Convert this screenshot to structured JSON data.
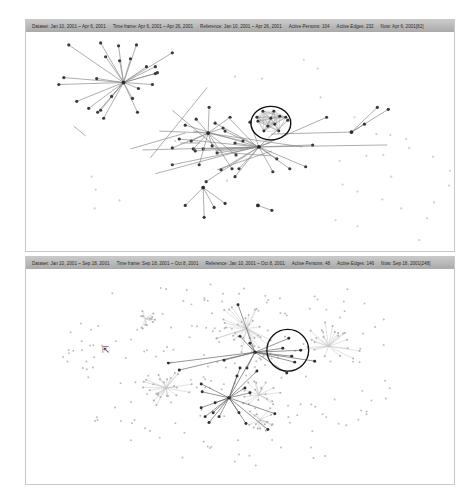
{
  "panels": [
    {
      "id": "top",
      "header": {
        "dataset": "Dataset: Jan 10, 2001 ~ Apr 6, 2001",
        "time_frame": "Time frame: Apr 6, 2001 ~ Apr 26, 2001",
        "reference": "Reference: Jan 10, 2001 ~ Apr 26, 2001",
        "active_persons": "Active Persons: 104",
        "active_edges": "Active Edges: 232",
        "now": "Now: Apr 6, 2001[82]"
      },
      "highlight_circle": {
        "cx": 246,
        "cy": 92,
        "r": 20
      },
      "hubs": [
        {
          "x": 98,
          "y": 51,
          "spokes": [
            [
              43,
              13
            ],
            [
              75,
              11
            ],
            [
              93,
              14
            ],
            [
              111,
              13
            ],
            [
              130,
              35
            ],
            [
              147,
              21
            ],
            [
              121,
              35
            ],
            [
              130,
              42
            ],
            [
              113,
              57
            ],
            [
              107,
              67
            ],
            [
              63,
              77
            ],
            [
              86,
              65
            ],
            [
              75,
              79
            ],
            [
              51,
              70
            ],
            [
              33,
              53
            ],
            [
              38,
              46
            ],
            [
              80,
              25
            ],
            [
              105,
              27
            ],
            [
              132,
              41
            ],
            [
              72,
              81
            ],
            [
              78,
              87
            ],
            [
              71,
              47
            ],
            [
              94,
              29
            ],
            [
              112,
              81
            ],
            [
              127,
              53
            ]
          ]
        },
        {
          "x": 234,
          "y": 116,
          "spokes": [
            [
              190,
              92
            ],
            [
              160,
              94
            ],
            [
              154,
              108
            ],
            [
              192,
              122
            ],
            [
              210,
              146
            ],
            [
              147,
              134
            ],
            [
              181,
              151
            ],
            [
              210,
              112
            ],
            [
              196,
              139
            ],
            [
              288,
              114
            ],
            [
              263,
              89
            ],
            [
              225,
              91
            ],
            [
              252,
              128
            ],
            [
              265,
              138
            ],
            [
              281,
              136
            ],
            [
              178,
              118
            ],
            [
              200,
              100
            ],
            [
              170,
              120
            ],
            [
              248,
              141
            ],
            [
              214,
              138
            ],
            [
              302,
              86
            ]
          ]
        },
        {
          "x": 183,
          "y": 102,
          "spokes": [
            [
              184,
              76
            ],
            [
              205,
              86
            ],
            [
              171,
              88
            ],
            [
              198,
              97
            ],
            [
              187,
              115
            ],
            [
              168,
              118
            ],
            [
              174,
              134
            ],
            [
              218,
              110
            ],
            [
              211,
              124
            ],
            [
              207,
              138
            ],
            [
              166,
              110
            ],
            [
              147,
              117
            ]
          ]
        },
        {
          "x": 178,
          "y": 157,
          "spokes": [
            [
              160,
              175
            ],
            [
              189,
              177
            ],
            [
              200,
              173
            ],
            [
              179,
              187
            ]
          ]
        },
        {
          "x": 327,
          "y": 101,
          "spokes": [
            [
              340,
              93
            ],
            [
              353,
              76
            ],
            [
              364,
              78
            ]
          ]
        },
        {
          "x": 233,
          "y": 175,
          "spokes": [
            [
              247,
              180
            ]
          ]
        }
      ],
      "edges": [
        [
          182,
          56,
          125,
          127
        ],
        [
          155,
          112,
          175,
          112
        ],
        [
          134,
          100,
          184,
          102
        ],
        [
          168,
          100,
          278,
          116
        ],
        [
          190,
          120,
          234,
          116
        ],
        [
          130,
          143,
          245,
          112
        ],
        [
          192,
          139,
          247,
          120
        ],
        [
          206,
          122,
          246,
          125
        ],
        [
          117,
          119,
          234,
          116
        ],
        [
          327,
          101,
          246,
          103
        ],
        [
          234,
          116,
          363,
          114
        ],
        [
          48,
          95,
          60,
          105
        ],
        [
          105,
          118,
          160,
          102
        ],
        [
          147,
          79,
          198,
          122
        ],
        [
          205,
          88,
          232,
          116
        ]
      ],
      "faint_nodes": [
        [
          210,
          45
        ],
        [
          279,
          28
        ],
        [
          293,
          37
        ],
        [
          237,
          47
        ],
        [
          296,
          66
        ],
        [
          330,
          86
        ],
        [
          352,
          103
        ],
        [
          382,
          108
        ],
        [
          385,
          117
        ],
        [
          342,
          125
        ],
        [
          359,
          124
        ],
        [
          366,
          104
        ],
        [
          315,
          130
        ],
        [
          367,
          146
        ],
        [
          318,
          154
        ],
        [
          333,
          161
        ],
        [
          358,
          169
        ],
        [
          311,
          190
        ],
        [
          333,
          196
        ],
        [
          377,
          178
        ],
        [
          395,
          210
        ],
        [
          403,
          188
        ],
        [
          410,
          172
        ],
        [
          425,
          155
        ],
        [
          426,
          140
        ],
        [
          409,
          126
        ],
        [
          66,
          146
        ],
        [
          70,
          159
        ],
        [
          69,
          178
        ],
        [
          94,
          170
        ],
        [
          150,
          110
        ],
        [
          202,
          150
        ]
      ],
      "cluster_nodes": [
        [
          238,
          80
        ],
        [
          249,
          80
        ],
        [
          261,
          86
        ],
        [
          254,
          100
        ],
        [
          239,
          100
        ],
        [
          233,
          90
        ],
        [
          246,
          87
        ],
        [
          250,
          93
        ],
        [
          243,
          95
        ],
        [
          232,
          86
        ],
        [
          255,
          85
        ]
      ]
    },
    {
      "id": "bottom",
      "header": {
        "dataset": "Dataset: Jan 10, 2001 ~ Sep 18, 2001",
        "time_frame": "Time frame: Sep 18, 2001 ~ Oct 8, 2001",
        "reference": "Reference: Jan 10, 2001 ~ Oct 8, 2001",
        "active_persons": "Active Persons: 48",
        "active_edges": "Active Edges: 146",
        "now": "Now: Sep 18, 2001[248]"
      },
      "highlight_circle": {
        "cx": 263,
        "cy": 82,
        "r": 21
      },
      "dark_hubs": [
        {
          "x": 230,
          "y": 84,
          "spokes": [
            [
              213,
              36
            ],
            [
              143,
              95
            ],
            [
              154,
              102
            ],
            [
              199,
              92
            ],
            [
              215,
              68
            ],
            [
              264,
              70
            ],
            [
              270,
              94
            ],
            [
              290,
              93
            ],
            [
              262,
              105
            ],
            [
              222,
              100
            ],
            [
              225,
              75
            ],
            [
              258,
              80
            ],
            [
              276,
              82
            ],
            [
              267,
              88
            ]
          ]
        },
        {
          "x": 204,
          "y": 130,
          "spokes": [
            [
              176,
              116
            ],
            [
              177,
              124
            ],
            [
              176,
              140
            ],
            [
              180,
              149
            ],
            [
              184,
              155
            ],
            [
              194,
              149
            ],
            [
              188,
              145
            ],
            [
              190,
              135
            ],
            [
              214,
              145
            ],
            [
              221,
              156
            ],
            [
              250,
              146
            ],
            [
              243,
              162
            ],
            [
              225,
              125
            ],
            [
              232,
              103
            ],
            [
              215,
              100
            ],
            [
              212,
              108
            ],
            [
              220,
              120
            ]
          ]
        }
      ],
      "gray_hubs": [
        {
          "x": 120,
          "y": 50,
          "n": 12,
          "r": 14
        },
        {
          "x": 141,
          "y": 120,
          "n": 26,
          "r": 28
        },
        {
          "x": 235,
          "y": 152,
          "n": 16,
          "r": 20
        },
        {
          "x": 234,
          "y": 127,
          "n": 18,
          "r": 22
        },
        {
          "x": 222,
          "y": 60,
          "n": 30,
          "r": 36
        },
        {
          "x": 304,
          "y": 78,
          "n": 22,
          "r": 36
        }
      ],
      "cursor": {
        "x": 76,
        "y": 77,
        "glyph": "⇱"
      }
    }
  ]
}
